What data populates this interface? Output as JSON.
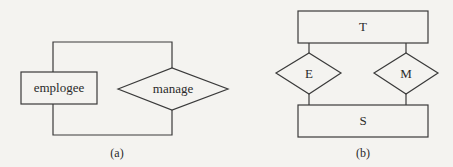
{
  "diagram_a": {
    "caption": "(a)",
    "entity": {
      "label": "emplogee"
    },
    "relationship": {
      "label": "manage"
    }
  },
  "diagram_b": {
    "caption": "(b)",
    "entities": [
      {
        "id": "T",
        "label": "T"
      },
      {
        "id": "S",
        "label": "S"
      }
    ],
    "relationships": [
      {
        "id": "E",
        "label": "E"
      },
      {
        "id": "M",
        "label": "M"
      }
    ]
  },
  "colors": {
    "background": "#f4f3f0",
    "stroke": "#3a3a3a",
    "text": "#2a2a2a"
  }
}
